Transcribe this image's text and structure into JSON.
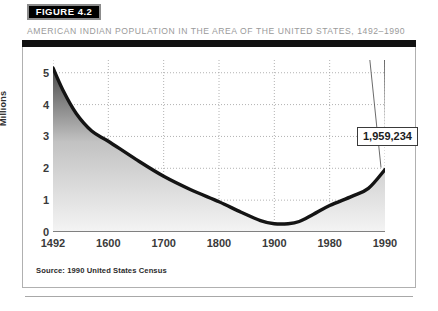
{
  "figure": {
    "badge_label": "FIGURE 4.2",
    "subtitle": "AMERICAN INDIAN POPULATION IN THE AREA OF THE UNITED STATES, 1492–1990",
    "source_note": "Source: 1990 United States Census"
  },
  "colors": {
    "badge_background": "#000000",
    "badge_border": "#8c8c8c",
    "subtitle_text": "#9a9a9a",
    "panel_border": "#b0b0b0",
    "panel_topbar": "#111111",
    "curve": "#141414",
    "fill_top": "#4a4a4a",
    "fill_bottom": "#f2f2f2",
    "gridline": "#9e9e9e",
    "axis_line": "#5a5a5a",
    "tick_text": "#3a3a3a",
    "callout_border": "#3a3a3a",
    "callout_text": "#1c1c1c"
  },
  "chart_data": {
    "type": "area",
    "title": "AMERICAN INDIAN POPULATION IN THE AREA OF THE UNITED STATES, 1492–1990",
    "xlabel": "",
    "ylabel": "Millions",
    "categories": [
      "1492",
      "1600",
      "1700",
      "1800",
      "1900",
      "1980",
      "1990"
    ],
    "values": [
      5.15,
      2.85,
      1.75,
      0.95,
      0.25,
      1.37,
      1.96
    ],
    "x_tick_labels": [
      "1492",
      "1600",
      "1700",
      "1800",
      "1900",
      "1980",
      "1990"
    ],
    "y_tick_labels": [
      "0",
      "1",
      "2",
      "3",
      "4",
      "5"
    ],
    "y_ticks": [
      0,
      1,
      2,
      3,
      4,
      5
    ],
    "ylim": [
      0,
      5.4
    ],
    "grid": true,
    "legend": "none",
    "annotations": [
      {
        "label": "1,959,234",
        "category": "1990",
        "value": 1.959234
      }
    ],
    "source": "Source: 1990 United States Census",
    "curve_points": [
      {
        "x": 0.0,
        "y": 5.15
      },
      {
        "x": 0.18,
        "y": 4.45
      },
      {
        "x": 0.42,
        "y": 3.72
      },
      {
        "x": 0.7,
        "y": 3.17
      },
      {
        "x": 1.0,
        "y": 2.85
      },
      {
        "x": 1.5,
        "y": 2.28
      },
      {
        "x": 2.0,
        "y": 1.75
      },
      {
        "x": 2.5,
        "y": 1.32
      },
      {
        "x": 3.0,
        "y": 0.95
      },
      {
        "x": 3.4,
        "y": 0.62
      },
      {
        "x": 3.75,
        "y": 0.36
      },
      {
        "x": 4.0,
        "y": 0.26
      },
      {
        "x": 4.25,
        "y": 0.26
      },
      {
        "x": 4.45,
        "y": 0.33
      },
      {
        "x": 4.7,
        "y": 0.55
      },
      {
        "x": 5.0,
        "y": 0.83
      },
      {
        "x": 5.4,
        "y": 1.12
      },
      {
        "x": 5.7,
        "y": 1.37
      },
      {
        "x": 6.0,
        "y": 1.96
      }
    ]
  }
}
